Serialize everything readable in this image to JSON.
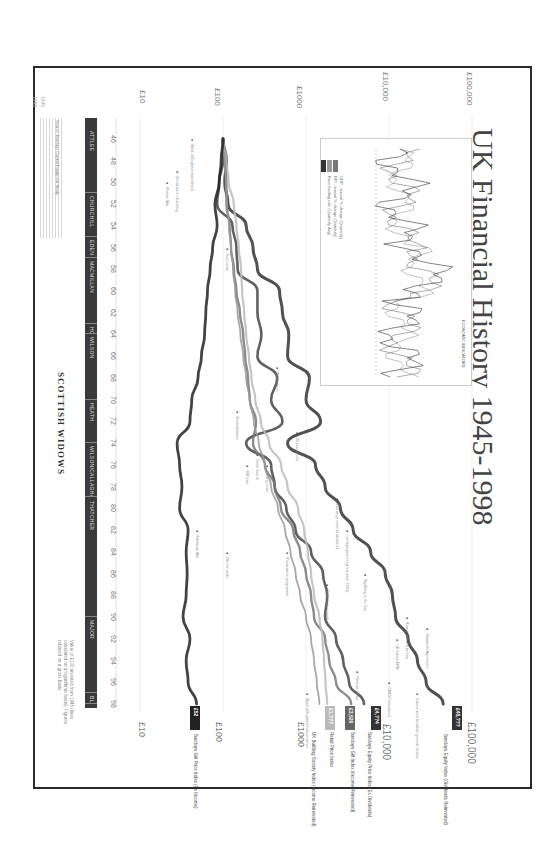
{
  "page": {
    "title": "UK Financial History 1945-1998",
    "publisher": "SCOTTISH WIDOWS",
    "corner_marks": [
      "1945",
      "1998"
    ]
  },
  "chart_data": {
    "type": "line",
    "title": "UK Financial History 1945-1998",
    "orientation": "rotated 90deg (years run top-to-bottom, value axis left-to-right)",
    "xlabel": "Year",
    "ylabel": "Value of £100 invested (log scale)",
    "yscale": "log",
    "ylim": [
      10,
      100000
    ],
    "value_ticks": [
      "£10",
      "£100",
      "£1000",
      "£10,000",
      "£100,000"
    ],
    "x": [
      1946,
      1948,
      1950,
      1952,
      1954,
      1956,
      1958,
      1960,
      1962,
      1964,
      1966,
      1968,
      1970,
      1972,
      1974,
      1976,
      1978,
      1980,
      1982,
      1984,
      1986,
      1988,
      1990,
      1992,
      1994,
      1996,
      1998
    ],
    "year_tick_labels": [
      "46",
      "48",
      "50",
      "52",
      "54",
      "56",
      "58",
      "60",
      "62",
      "64",
      "66",
      "68",
      "70",
      "72",
      "74",
      "76",
      "78",
      "80",
      "82",
      "84",
      "86",
      "88",
      "90",
      "92",
      "94",
      "96",
      "98"
    ],
    "series": [
      {
        "name": "Barclays Equity Index (Dividends Reinvested)",
        "color": "#333333",
        "values": [
          100,
          110,
          105,
          115,
          190,
          230,
          260,
          480,
          520,
          620,
          600,
          1100,
          1000,
          1500,
          600,
          1300,
          1700,
          2600,
          3700,
          6000,
          9000,
          11000,
          12000,
          17000,
          22000,
          28000,
          45000
        ]
      },
      {
        "name": "Barclays Equity Price Index (Ex Dividends)",
        "color": "#444444",
        "values": [
          100,
          100,
          90,
          85,
          130,
          145,
          150,
          260,
          260,
          290,
          260,
          450,
          380,
          520,
          190,
          380,
          420,
          580,
          750,
          1150,
          1600,
          1800,
          1700,
          2300,
          2800,
          3300,
          5000
        ]
      },
      {
        "name": "Barclays Gilt Index (Income Reinvested)",
        "color": "#777777",
        "values": [
          100,
          105,
          110,
          110,
          120,
          125,
          135,
          145,
          160,
          175,
          185,
          200,
          210,
          250,
          230,
          320,
          420,
          500,
          700,
          850,
          1000,
          1150,
          1250,
          1700,
          1900,
          2300,
          3500
        ]
      },
      {
        "name": "Retail Price Index",
        "color": "#bbbbbb",
        "values": [
          100,
          110,
          117,
          135,
          145,
          155,
          165,
          170,
          180,
          190,
          205,
          220,
          245,
          285,
          360,
          500,
          600,
          800,
          950,
          1050,
          1150,
          1250,
          1450,
          1580,
          1650,
          1720,
          1800
        ]
      },
      {
        "name": "UK Building Society Index (Income Reinvested)",
        "color": "#999999",
        "values": [
          100,
          105,
          108,
          112,
          118,
          125,
          132,
          140,
          150,
          162,
          175,
          190,
          210,
          235,
          270,
          320,
          380,
          460,
          560,
          650,
          750,
          850,
          1000,
          1150,
          1250,
          1350,
          1450
        ]
      },
      {
        "name": "Barclays Gilt Price Index (Ex Income)",
        "color": "#222222",
        "values": [
          100,
          95,
          90,
          80,
          85,
          75,
          70,
          65,
          62,
          60,
          55,
          50,
          42,
          40,
          28,
          30,
          32,
          30,
          38,
          36,
          37,
          36,
          33,
          40,
          36,
          38,
          48
        ]
      }
    ],
    "end_labels": [
      {
        "series": "Barclays Equity Index",
        "box": "£45,???",
        "note": "(Dividends Reinvested)"
      },
      {
        "series": "Barclays Equity Price Index",
        "box": "£4,??4",
        "note": "(Ex Dividends)"
      },
      {
        "series": "Barclays Gilt Index",
        "box": "£3,520",
        "note": "(Income Reinvested)"
      },
      {
        "series": "Retail Price Index",
        "box": "£1,???",
        "note": ""
      },
      {
        "series": "UK Building Society Index",
        "box": "",
        "note": "(Income Reinvested)"
      },
      {
        "series": "Barclays Gilt Price Index",
        "box": "£52",
        "note": "(Ex Income)"
      }
    ],
    "grid": true,
    "legend_position": "right end of each line"
  },
  "prime_ministers": [
    {
      "name": "ATTLEE",
      "from": 1945,
      "to": 1951
    },
    {
      "name": "CHURCHILL",
      "from": 1951,
      "to": 1955
    },
    {
      "name": "EDEN",
      "from": 1955,
      "to": 1957
    },
    {
      "name": "MACMILLAN",
      "from": 1957,
      "to": 1963
    },
    {
      "name": "HOME",
      "from": 1963,
      "to": 1964
    },
    {
      "name": "WILSON",
      "from": 1964,
      "to": 1970
    },
    {
      "name": "HEATH",
      "from": 1970,
      "to": 1974
    },
    {
      "name": "WILSON/CALLAGHAN",
      "from": 1974,
      "to": 1979
    },
    {
      "name": "THATCHER",
      "from": 1979,
      "to": 1990
    },
    {
      "name": "MAJOR",
      "from": 1990,
      "to": 1997
    },
    {
      "name": "BLAIR",
      "from": 1997,
      "to": 1998
    }
  ],
  "inset": {
    "title": "ECONOMIC INDICATORS",
    "legend": [
      {
        "label": "GDP - annual % change (Quarterly)",
        "color": "#999999"
      },
      {
        "label": "RPI - annual % change (Quarterly)",
        "color": "#777777"
      },
      {
        "label": "Base lending rate (Quarterly Avg)",
        "color": "#333333"
      }
    ]
  },
  "annotations": [
    {
      "text": "Maastricht Agreement",
      "year": 1991
    },
    {
      "text": "UK leaves ERM",
      "year": 1992
    },
    {
      "text": "Kuwait invaded by Iraq",
      "year": 1990
    },
    {
      "text": "Labour wins landslide general election",
      "year": 1997
    },
    {
      "text": "Mexican Crisis",
      "year": 1995
    },
    {
      "text": "CREST introduced",
      "year": 1996
    },
    {
      "text": "Unemployment highest since 1930s",
      "year": 1982
    },
    {
      "text": "Big Bang in the City",
      "year": 1986
    },
    {
      "text": "Stock market crash",
      "year": 1987
    },
    {
      "text": "Oil price shock",
      "year": 1973
    },
    {
      "text": "Devaluation",
      "year": 1967
    },
    {
      "text": "Sterling crisis",
      "year": 1976
    },
    {
      "text": "IMF loan",
      "year": 1976
    },
    {
      "text": "North Sea oil",
      "year": 1975
    },
    {
      "text": "Decimalisation",
      "year": 1971
    },
    {
      "text": "Suez crisis",
      "year": 1956
    },
    {
      "text": "Korean War",
      "year": 1950
    },
    {
      "text": "Devaluation of sterling",
      "year": 1949
    },
    {
      "text": "Bank of England nationalised",
      "year": 1946
    },
    {
      "text": "Exchange controls abolished",
      "year": 1979
    },
    {
      "text": "Bank of England independence",
      "year": 1997
    },
    {
      "text": "Privatisation programme",
      "year": 1984
    },
    {
      "text": "Miners' strike",
      "year": 1984
    },
    {
      "text": "Falklands War",
      "year": 1982
    }
  ],
  "footnote": "Value of £100 invested from 1945 (lines calculated on a logarithmic basis). Figures rebased on a gross basis.",
  "side_note": "Source: Barclays Capital Equity-Gilt Study"
}
